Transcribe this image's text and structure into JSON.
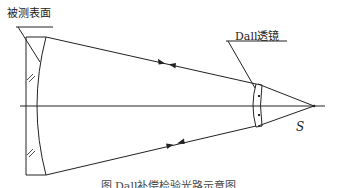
{
  "figure": {
    "labels": {
      "test_surface": "被测表面",
      "dall_lens": "Dall透镜",
      "point_source": "S"
    },
    "caption": "图 Dall补偿检验光路示意图",
    "elements": [
      "optical-axis",
      "test-surface (concave mirror)",
      "dall-lens",
      "incident rays",
      "reflected rays",
      "point-source S"
    ],
    "colors": {
      "line": "#222222",
      "background": "#ffffff"
    }
  }
}
